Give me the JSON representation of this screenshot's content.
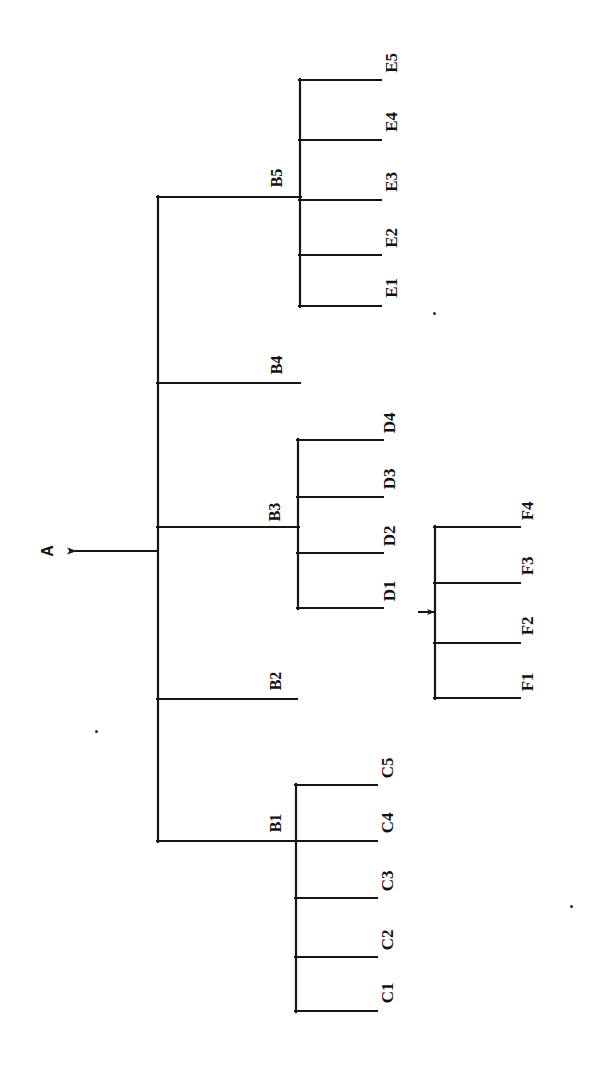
{
  "figure": {
    "type": "hierarchical-tree-diagram",
    "orientation": "rotated-90-clockwise",
    "background_color": "#ffffff",
    "ink_color": "#161616",
    "title": ""
  },
  "nodes": {
    "root": {
      "label": "A",
      "x": 48,
      "y": 551
    },
    "internal": [
      {
        "label": "B5",
        "x": 277,
        "y": 178
      },
      {
        "label": "B4",
        "x": 277,
        "y": 365
      },
      {
        "label": "B3",
        "x": 275,
        "y": 512
      },
      {
        "label": "B2",
        "x": 276,
        "y": 681
      },
      {
        "label": "B1",
        "x": 276,
        "y": 823
      }
    ],
    "leaves": [
      {
        "label": "E5",
        "x": 392,
        "y": 63
      },
      {
        "label": "E4",
        "x": 392,
        "y": 122
      },
      {
        "label": "E3",
        "x": 392,
        "y": 182
      },
      {
        "label": "E2",
        "x": 392,
        "y": 238
      },
      {
        "label": "E1",
        "x": 392,
        "y": 288
      },
      {
        "label": "D4",
        "x": 390,
        "y": 423
      },
      {
        "label": "D3",
        "x": 390,
        "y": 479
      },
      {
        "label": "D2",
        "x": 390,
        "y": 536
      },
      {
        "label": "D1",
        "x": 390,
        "y": 591
      },
      {
        "label": "F4",
        "x": 528,
        "y": 511
      },
      {
        "label": "F3",
        "x": 528,
        "y": 566
      },
      {
        "label": "F2",
        "x": 528,
        "y": 626
      },
      {
        "label": "F1",
        "x": 528,
        "y": 682
      },
      {
        "label": "C5",
        "x": 388,
        "y": 768
      },
      {
        "label": "C4",
        "x": 388,
        "y": 823
      },
      {
        "label": "C3",
        "x": 388,
        "y": 881
      },
      {
        "label": "C2",
        "x": 388,
        "y": 940
      },
      {
        "label": "C1",
        "x": 388,
        "y": 993
      }
    ]
  },
  "structure": {
    "A": [
      "B1",
      "B2",
      "B3",
      "B4",
      "B5"
    ],
    "B5": [
      "E1",
      "E2",
      "E3",
      "E4",
      "E5"
    ],
    "B4": [],
    "B3": [
      "D1",
      "D2",
      "D3",
      "D4"
    ],
    "B2": [],
    "B1": [
      "C1",
      "C2",
      "C3",
      "C4",
      "C5"
    ],
    "D1": [
      "F1",
      "F2",
      "F3",
      "F4"
    ]
  },
  "geometry": {
    "root_stem": {
      "x1": 72,
      "y1": 551,
      "x2": 158,
      "y2": 551
    },
    "main_trunk": {
      "x": 158,
      "y1": 197,
      "y2": 841
    },
    "trunk_branches": [
      {
        "name": "branch-to-B5",
        "x1": 158,
        "y": 197,
        "x2": 300
      },
      {
        "name": "branch-to-B4",
        "x1": 158,
        "y": 383,
        "x2": 300
      },
      {
        "name": "branch-to-B3",
        "x1": 158,
        "y": 527,
        "x2": 298
      },
      {
        "name": "branch-to-B2",
        "x1": 158,
        "y": 699,
        "x2": 297
      },
      {
        "name": "branch-to-B1",
        "x1": 158,
        "y": 841,
        "x2": 296
      }
    ],
    "e_cluster": {
      "spine_x": 300,
      "spine_y1": 80,
      "spine_y2": 306,
      "leaf_end_x": 381,
      "leaf_y": [
        80,
        140,
        200,
        255,
        306
      ]
    },
    "d_cluster": {
      "spine_x": 298,
      "spine_y1": 440,
      "spine_y2": 608,
      "leaf_end_x": 383,
      "leaf_y": [
        440,
        497,
        553,
        608
      ]
    },
    "f_cluster": {
      "spine_x": 435,
      "spine_y1": 527,
      "spine_y2": 698,
      "leaf_end_x": 520,
      "leaf_y": [
        527,
        583,
        643,
        698
      ],
      "inbound_arrow": {
        "x1": 418,
        "y": 612,
        "x2": 435
      }
    },
    "c_cluster": {
      "spine_x": 296,
      "spine_y1": 785,
      "spine_y2": 1011,
      "leaf_end_x": 377,
      "leaf_y": [
        785,
        841,
        898,
        957,
        1011
      ]
    },
    "root_arrowhead": {
      "x": 72,
      "y": 551
    }
  },
  "specks": [
    {
      "x": 433,
      "y": 312,
      "size": 3
    },
    {
      "x": 95,
      "y": 730,
      "size": 3
    },
    {
      "x": 570,
      "y": 905,
      "size": 3
    }
  ]
}
